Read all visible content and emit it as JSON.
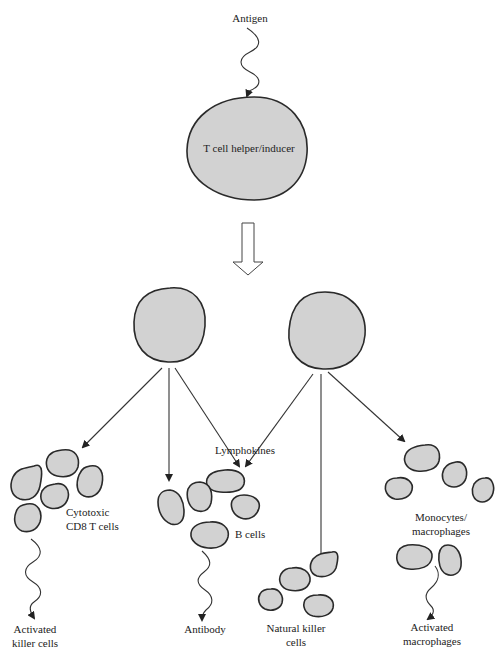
{
  "diagram": {
    "labels": {
      "antigen": "Antigen",
      "helper": "T cell helper/inducer",
      "lymphokines": "Lymphokines",
      "cytotoxic_1": "Cytotoxic",
      "cytotoxic_2": "CD8 T cells",
      "bcells": "B cells",
      "monocytes_1": "Monocytes/",
      "monocytes_2": "macrophages",
      "nk_1": "Natural killer",
      "nk_2": "cells",
      "activated_killer_1": "Activated",
      "activated_killer_2": "killer cells",
      "antibody": "Antibody",
      "activated_macro_1": "Activated",
      "activated_macro_2": "macrophages"
    },
    "nodes": [
      {
        "id": "antigen",
        "label": "Antigen"
      },
      {
        "id": "helper",
        "label": "T cell helper/inducer"
      },
      {
        "id": "daughter_left",
        "label": ""
      },
      {
        "id": "daughter_right",
        "label": ""
      },
      {
        "id": "cytotoxic",
        "label": "Cytotoxic CD8 T cells"
      },
      {
        "id": "bcells",
        "label": "B cells"
      },
      {
        "id": "nk",
        "label": "Natural killer cells"
      },
      {
        "id": "monocytes",
        "label": "Monocytes/macrophages"
      },
      {
        "id": "activated_killer",
        "label": "Activated killer cells"
      },
      {
        "id": "antibody",
        "label": "Antibody"
      },
      {
        "id": "activated_macro",
        "label": "Activated macrophages"
      }
    ],
    "edges": [
      {
        "from": "antigen",
        "to": "helper",
        "style": "wavy"
      },
      {
        "from": "helper",
        "to": "daughter_left",
        "style": "hollow-arrow"
      },
      {
        "from": "helper",
        "to": "daughter_right",
        "style": "hollow-arrow"
      },
      {
        "from": "daughter_left",
        "to": "cytotoxic",
        "style": "arrow"
      },
      {
        "from": "daughter_left",
        "to": "bcells",
        "style": "arrow"
      },
      {
        "from": "daughter_left",
        "to": "bcells",
        "style": "arrow",
        "label": "Lymphokines"
      },
      {
        "from": "daughter_right",
        "to": "bcells",
        "style": "arrow"
      },
      {
        "from": "daughter_right",
        "to": "nk",
        "style": "arrow"
      },
      {
        "from": "daughter_right",
        "to": "monocytes",
        "style": "arrow"
      },
      {
        "from": "cytotoxic",
        "to": "activated_killer",
        "style": "wavy"
      },
      {
        "from": "bcells",
        "to": "antibody",
        "style": "wavy"
      },
      {
        "from": "monocytes",
        "to": "activated_macro",
        "style": "wavy"
      }
    ],
    "colors": {
      "cell_fill": "#d2d2d2",
      "outline": "#2a2a2a",
      "background": "#ffffff"
    }
  }
}
